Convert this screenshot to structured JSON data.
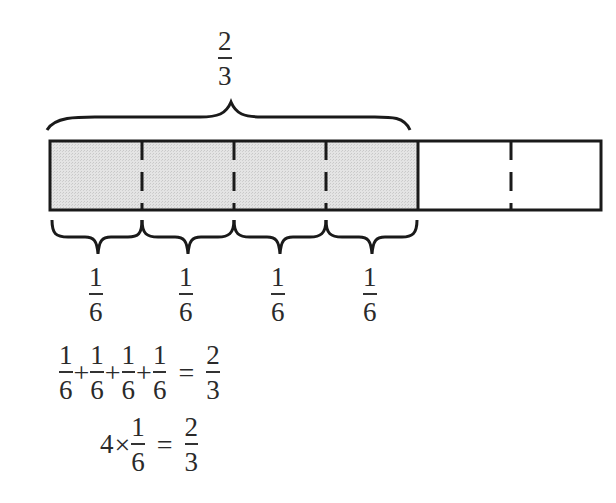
{
  "diagram": {
    "type": "fraction-bar-model",
    "bar": {
      "total_parts": 6,
      "shaded_parts": 4,
      "shade_color": "#dcdcdc",
      "outline_color": "#1a1a1a"
    },
    "top_label": {
      "numerator": "2",
      "denominator": "3"
    },
    "part_labels": [
      {
        "numerator": "1",
        "denominator": "6"
      },
      {
        "numerator": "1",
        "denominator": "6"
      },
      {
        "numerator": "1",
        "denominator": "6"
      },
      {
        "numerator": "1",
        "denominator": "6"
      }
    ],
    "equation1": {
      "terms": [
        {
          "numerator": "1",
          "denominator": "6"
        },
        {
          "numerator": "1",
          "denominator": "6"
        },
        {
          "numerator": "1",
          "denominator": "6"
        },
        {
          "numerator": "1",
          "denominator": "6"
        }
      ],
      "plus": "+",
      "equals": "=",
      "result": {
        "numerator": "2",
        "denominator": "3"
      }
    },
    "equation2": {
      "multiplier": "4",
      "times": "×",
      "term": {
        "numerator": "1",
        "denominator": "6"
      },
      "equals": "=",
      "result": {
        "numerator": "2",
        "denominator": "3"
      }
    }
  }
}
